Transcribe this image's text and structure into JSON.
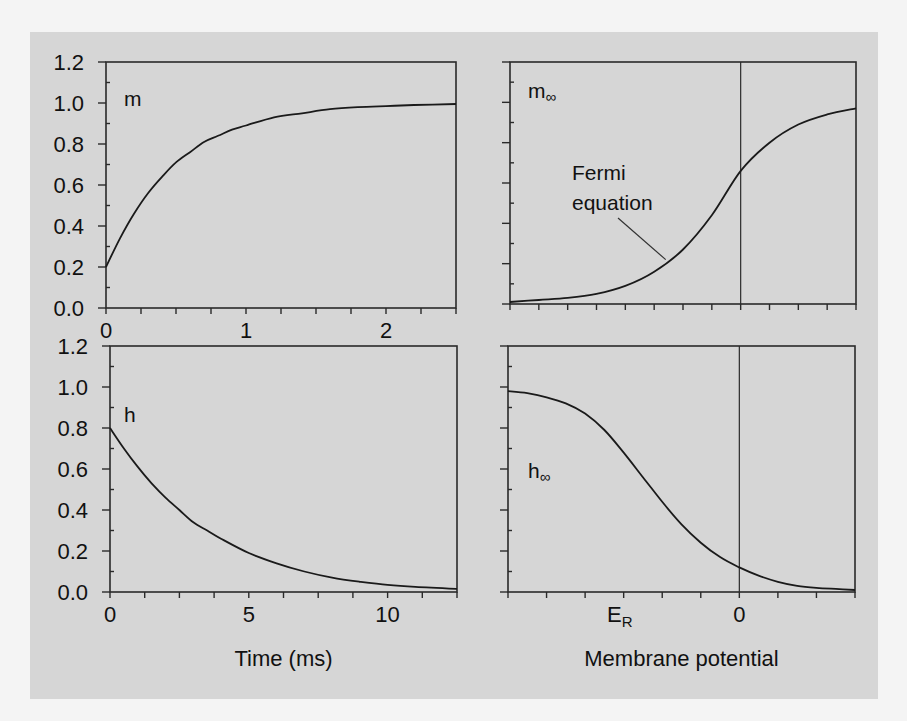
{
  "colors": {
    "figure_background": "#d6d6d6",
    "page_background": "#f4f4f4",
    "line": "#1a1a1a"
  },
  "chart_data": [
    {
      "id": "m_time",
      "type": "line",
      "title": "",
      "panel_label": "m",
      "xlabel": "",
      "ylabel": "",
      "xlim": [
        0,
        2.5
      ],
      "ylim": [
        0,
        1.2
      ],
      "x_ticks": [
        0,
        1,
        2
      ],
      "x_tick_labels": [
        "0",
        "1",
        "2"
      ],
      "x_minor_step": 0.25,
      "y_ticks": [
        0.0,
        0.2,
        0.4,
        0.6,
        0.8,
        1.0,
        1.2
      ],
      "y_tick_labels": [
        "0.0",
        "0.2",
        "0.4",
        "0.6",
        "0.8",
        "1.0",
        "1.2"
      ],
      "y_minor_step": 0.1,
      "grid": false,
      "series": [
        {
          "name": "m",
          "x": [
            0,
            0.1,
            0.2,
            0.3,
            0.4,
            0.5,
            0.6,
            0.7,
            0.8,
            0.9,
            1.0,
            1.2,
            1.4,
            1.6,
            1.8,
            2.0,
            2.2,
            2.5
          ],
          "y": [
            0.2,
            0.34,
            0.46,
            0.56,
            0.64,
            0.71,
            0.76,
            0.81,
            0.84,
            0.87,
            0.89,
            0.93,
            0.95,
            0.97,
            0.98,
            0.985,
            0.99,
            0.995
          ]
        }
      ]
    },
    {
      "id": "m_inf",
      "type": "line",
      "title": "",
      "panel_label": "m",
      "panel_label_sub": "∞",
      "xlabel": "",
      "ylabel": "",
      "xlim": [
        -8,
        4
      ],
      "ylim": [
        0,
        1.2
      ],
      "x_ticks": [
        -8,
        -7,
        -6,
        -5,
        -4,
        -3,
        -2,
        -1,
        0,
        1,
        2,
        3,
        4
      ],
      "y_ticks": [
        0.0,
        0.2,
        0.4,
        0.6,
        0.8,
        1.0,
        1.2
      ],
      "y_minor_step": 0.1,
      "zero_line_x": 0,
      "grid": false,
      "annotations": [
        {
          "text_lines": [
            "Fermi",
            "equation"
          ],
          "points_to": [
            -2.6,
            0.22
          ]
        }
      ],
      "series": [
        {
          "name": "m_inf (Fermi equation)",
          "x": [
            -8,
            -7,
            -6,
            -5,
            -4,
            -3,
            -2,
            -1,
            0,
            1,
            2,
            3,
            4
          ],
          "y": [
            0.01,
            0.02,
            0.03,
            0.05,
            0.09,
            0.16,
            0.27,
            0.44,
            0.66,
            0.8,
            0.89,
            0.94,
            0.97
          ]
        }
      ]
    },
    {
      "id": "h_time",
      "type": "line",
      "title": "",
      "panel_label": "h",
      "xlabel": "Time (ms)",
      "ylabel": "",
      "xlim": [
        0,
        12.5
      ],
      "ylim": [
        0,
        1.2
      ],
      "x_ticks": [
        0,
        5,
        10
      ],
      "x_tick_labels": [
        "0",
        "5",
        "10"
      ],
      "x_minor_step": 1.25,
      "y_ticks": [
        0.0,
        0.2,
        0.4,
        0.6,
        0.8,
        1.0,
        1.2
      ],
      "y_tick_labels": [
        "0.0",
        "0.2",
        "0.4",
        "0.6",
        "0.8",
        "1.0",
        "1.2"
      ],
      "y_minor_step": 0.1,
      "grid": false,
      "series": [
        {
          "name": "h",
          "x": [
            0,
            0.5,
            1,
            1.5,
            2,
            2.5,
            3,
            3.5,
            4,
            5,
            6,
            7,
            8,
            9,
            10,
            11,
            12.5
          ],
          "y": [
            0.8,
            0.7,
            0.61,
            0.53,
            0.46,
            0.4,
            0.34,
            0.3,
            0.26,
            0.19,
            0.14,
            0.1,
            0.07,
            0.05,
            0.035,
            0.025,
            0.015
          ]
        }
      ]
    },
    {
      "id": "h_inf",
      "type": "line",
      "title": "",
      "panel_label": "h",
      "panel_label_sub": "∞",
      "xlabel": "Membrane potential",
      "ylabel": "",
      "xlim": [
        -6,
        3
      ],
      "ylim": [
        0,
        1.2
      ],
      "x_ticks": [
        -6,
        -5,
        -4,
        -3,
        -2,
        -1,
        0,
        1,
        2,
        3
      ],
      "x_tick_labels_custom": [
        {
          "x": -3.1,
          "text": "E",
          "sub": "R"
        },
        {
          "x": 0,
          "text": "0"
        }
      ],
      "y_ticks": [
        0.0,
        0.2,
        0.4,
        0.6,
        0.8,
        1.0,
        1.2
      ],
      "y_minor_step": 0.1,
      "zero_line_x": 0,
      "grid": false,
      "series": [
        {
          "name": "h_inf",
          "x": [
            -6,
            -5.5,
            -5,
            -4.5,
            -4,
            -3.5,
            -3,
            -2.5,
            -2,
            -1.5,
            -1,
            -0.5,
            0,
            0.5,
            1,
            1.5,
            2,
            2.5,
            3
          ],
          "y": [
            0.98,
            0.97,
            0.95,
            0.92,
            0.87,
            0.79,
            0.68,
            0.56,
            0.44,
            0.33,
            0.24,
            0.17,
            0.12,
            0.08,
            0.05,
            0.03,
            0.02,
            0.015,
            0.01
          ]
        }
      ]
    }
  ],
  "layout_panels": [
    {
      "chart": 0,
      "left": 106,
      "top": 62,
      "right": 456,
      "bottom": 308,
      "label_pos": [
        124,
        106
      ],
      "show_y_labels": true
    },
    {
      "chart": 1,
      "left": 510,
      "top": 62,
      "right": 856,
      "bottom": 304,
      "label_pos": [
        528,
        98
      ],
      "show_y_labels": false,
      "annot_pos": [
        572,
        180
      ]
    },
    {
      "chart": 2,
      "left": 110,
      "top": 346,
      "right": 457,
      "bottom": 592,
      "label_pos": [
        124,
        422
      ],
      "show_y_labels": true
    },
    {
      "chart": 3,
      "left": 508,
      "top": 346,
      "right": 855,
      "bottom": 592,
      "label_pos": [
        528,
        478
      ],
      "show_y_labels": false
    }
  ]
}
